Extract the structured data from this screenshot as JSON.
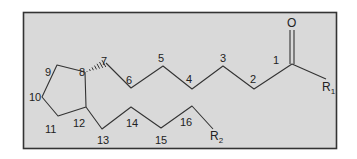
{
  "figure": {
    "frame": {
      "x": 23,
      "y": 12,
      "width": 314,
      "height": 137,
      "fill": "#d9d9d9",
      "stroke": "#333333"
    },
    "bond_color": "#333333"
  },
  "atoms": {
    "oxygen": "O",
    "r1": {
      "base": "R",
      "sub": "1"
    },
    "r2": {
      "base": "R",
      "sub": "2"
    }
  },
  "carbon_labels": {
    "c1": "1",
    "c2": "2",
    "c3": "3",
    "c4": "4",
    "c5": "5",
    "c6": "6",
    "c7": "7",
    "c8": "8",
    "c9": "9",
    "c10": "10",
    "c11": "11",
    "c12": "12",
    "c13": "13",
    "c14": "14",
    "c15": "15",
    "c16": "16"
  }
}
